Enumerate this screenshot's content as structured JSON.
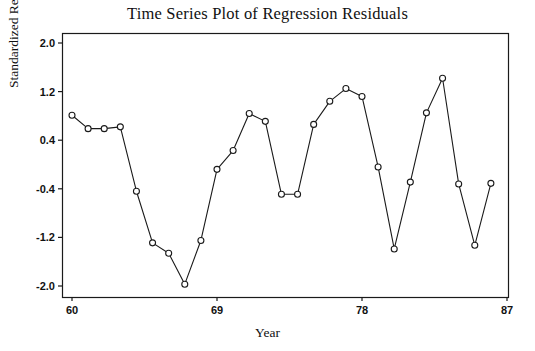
{
  "chart_data": {
    "type": "line",
    "title": "Time Series Plot of Regression Residuals",
    "xlabel": "Year",
    "ylabel": "Standardized Residuals",
    "grid": false,
    "legend": "none",
    "marker": "open-circle",
    "xlim": [
      60,
      87
    ],
    "ylim": [
      -2.0,
      2.0
    ],
    "xticks": [
      60,
      69,
      78,
      87
    ],
    "xtick_labels": [
      "60",
      "69",
      "78",
      "87"
    ],
    "yticks": [
      2.0,
      1.2,
      0.4,
      -0.4,
      -1.2,
      -2.0
    ],
    "ytick_labels": [
      "2.0",
      "1.2",
      "0.4",
      "-0.4",
      "-1.2",
      "-2.0"
    ],
    "x": [
      60,
      61,
      62,
      63,
      64,
      65,
      66,
      67,
      68,
      69,
      70,
      71,
      72,
      73,
      74,
      75,
      76,
      77,
      78,
      79,
      80,
      81,
      82,
      83,
      84,
      85,
      86
    ],
    "y": [
      0.81,
      0.59,
      0.59,
      0.62,
      -0.44,
      -1.29,
      -1.42,
      -1.97,
      -1.25,
      -0.08,
      0.23,
      0.84,
      0.74,
      -0.48,
      -0.48,
      0.68,
      1.04,
      1.28,
      1.2,
      -0.6,
      -0.31,
      0.88,
      1.48,
      -0.44,
      -1.29,
      -0.32
    ],
    "series": [
      {
        "name": "Standardized Residuals",
        "points": [
          {
            "x": 60,
            "y": 0.81
          },
          {
            "x": 61,
            "y": 0.59
          },
          {
            "x": 62,
            "y": 0.59
          },
          {
            "x": 63,
            "y": 0.62
          },
          {
            "x": 64,
            "y": -0.44
          },
          {
            "x": 65,
            "y": -1.29
          },
          {
            "x": 66,
            "y": -1.46
          },
          {
            "x": 67,
            "y": -1.97
          },
          {
            "x": 68,
            "y": -1.25
          },
          {
            "x": 69,
            "y": -0.08
          },
          {
            "x": 70,
            "y": 0.23
          },
          {
            "x": 71,
            "y": 0.84
          },
          {
            "x": 72,
            "y": 0.71
          },
          {
            "x": 73,
            "y": -0.49
          },
          {
            "x": 74,
            "y": -0.49
          },
          {
            "x": 75,
            "y": 0.66
          },
          {
            "x": 76,
            "y": 1.04
          },
          {
            "x": 77,
            "y": 1.25
          },
          {
            "x": 78,
            "y": 1.12
          },
          {
            "x": 79,
            "y": -0.04
          },
          {
            "x": 80,
            "y": -1.39
          },
          {
            "x": 81,
            "y": -0.29
          },
          {
            "x": 82,
            "y": 0.85
          },
          {
            "x": 83,
            "y": 1.42
          },
          {
            "x": 84,
            "y": -0.32
          },
          {
            "x": 85,
            "y": -1.33
          },
          {
            "x": 86,
            "y": -0.31
          }
        ]
      }
    ],
    "axes_pixels": {
      "left": 62,
      "right": 508,
      "top": 33,
      "bottom": 297,
      "x_at_60": 72,
      "x_at_87": 507,
      "y_at_2": 43,
      "y_at_neg2": 286
    },
    "colors": {
      "line": "#1a1a1a",
      "marker_fill": "#ffffff",
      "marker_stroke": "#1a1a1a",
      "axis": "#1a1a1a",
      "background": "#ffffff",
      "text": "#111111"
    }
  }
}
